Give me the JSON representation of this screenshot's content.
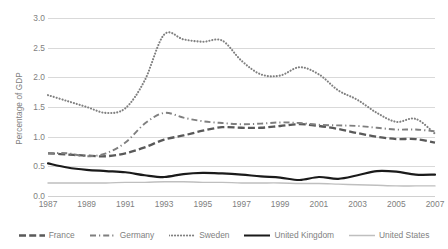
{
  "chart_data": {
    "type": "line",
    "title": "",
    "xlabel": "",
    "ylabel": "Percentage of GDP",
    "xlim": [
      1987,
      2007
    ],
    "ylim": [
      0.0,
      3.0
    ],
    "grid": true,
    "legend_position": "bottom",
    "y_ticks": [
      "0.0",
      "0.5",
      "1.0",
      "1.5",
      "2.0",
      "2.5",
      "3.0"
    ],
    "y_tick_values": [
      0.0,
      0.5,
      1.0,
      1.5,
      2.0,
      2.5,
      3.0
    ],
    "x_ticks": [
      "1987",
      "1989",
      "1991",
      "1993",
      "1995",
      "1997",
      "1999",
      "2001",
      "2003",
      "2005",
      "2007"
    ],
    "x_tick_values": [
      1987,
      1989,
      1991,
      1993,
      1995,
      1997,
      1999,
      2001,
      2003,
      2005,
      2007
    ],
    "x": [
      1987,
      1988,
      1989,
      1990,
      1991,
      1992,
      1993,
      1994,
      1995,
      1996,
      1997,
      1998,
      1999,
      2000,
      2001,
      2002,
      2003,
      2004,
      2005,
      2006,
      2007
    ],
    "series": [
      {
        "name": "France",
        "color": "#595959",
        "style": "dashed",
        "values": [
          0.72,
          0.7,
          0.68,
          0.67,
          0.72,
          0.82,
          0.95,
          1.02,
          1.1,
          1.16,
          1.15,
          1.15,
          1.18,
          1.21,
          1.18,
          1.13,
          1.06,
          1.0,
          0.96,
          0.96,
          0.9
        ]
      },
      {
        "name": "Germany",
        "color": "#7f7f7f",
        "style": "dash-dot",
        "values": [
          0.72,
          0.72,
          0.67,
          0.72,
          0.9,
          1.22,
          1.4,
          1.32,
          1.26,
          1.23,
          1.21,
          1.22,
          1.24,
          1.23,
          1.2,
          1.19,
          1.18,
          1.15,
          1.12,
          1.12,
          1.09
        ]
      },
      {
        "name": "Sweden",
        "color": "#808080",
        "style": "dotted",
        "values": [
          1.7,
          1.6,
          1.5,
          1.4,
          1.48,
          1.95,
          2.72,
          2.64,
          2.6,
          2.62,
          2.28,
          2.05,
          2.03,
          2.17,
          2.05,
          1.78,
          1.62,
          1.4,
          1.25,
          1.3,
          1.05
        ]
      },
      {
        "name": "United Kingdom",
        "color": "#1a1a1a",
        "style": "solid-thick",
        "values": [
          0.55,
          0.48,
          0.44,
          0.42,
          0.4,
          0.35,
          0.32,
          0.37,
          0.39,
          0.38,
          0.36,
          0.33,
          0.31,
          0.27,
          0.32,
          0.29,
          0.35,
          0.42,
          0.41,
          0.36,
          0.36
        ]
      },
      {
        "name": "United States",
        "color": "#bfbfbf",
        "style": "solid-thin",
        "values": [
          0.22,
          0.22,
          0.22,
          0.22,
          0.23,
          0.23,
          0.24,
          0.24,
          0.23,
          0.23,
          0.22,
          0.22,
          0.22,
          0.21,
          0.21,
          0.2,
          0.19,
          0.18,
          0.17,
          0.17,
          0.17
        ]
      }
    ]
  }
}
